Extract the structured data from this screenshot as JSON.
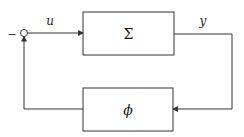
{
  "diagram": {
    "type": "feedback-loop",
    "blocks": [
      {
        "id": "forward",
        "label": "Σ"
      },
      {
        "id": "feedback",
        "label": "ϕ"
      }
    ],
    "signals": {
      "input": "u",
      "output": "y"
    },
    "summing_junction": {
      "sign": "−"
    },
    "colors": {
      "stroke": "#333333",
      "background": "#ffffff"
    }
  }
}
